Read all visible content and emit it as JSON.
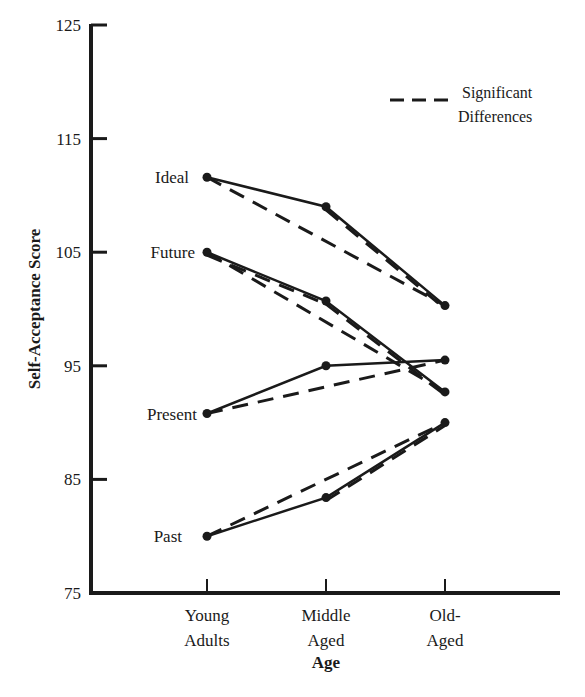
{
  "chart_data": {
    "type": "line",
    "title": "",
    "xlabel": "Age",
    "ylabel": "Self-Acceptance Score",
    "ylim": [
      75,
      125
    ],
    "yticks": [
      75,
      85,
      95,
      105,
      115,
      125
    ],
    "categories": [
      "Young Adults",
      "Middle Aged",
      "Old-Aged"
    ],
    "category_lines": [
      [
        "Young",
        "Adults"
      ],
      [
        "Middle",
        "Aged"
      ],
      [
        "Old-",
        "Aged"
      ]
    ],
    "grid": false,
    "legend": {
      "position": "top-right",
      "entries": [
        {
          "style": "dashed",
          "label_lines": [
            "Significant",
            "Differences"
          ],
          "label": "Significant Differences"
        }
      ]
    },
    "series": [
      {
        "name": "Ideal",
        "values": [
          111.6,
          109.0,
          100.3
        ]
      },
      {
        "name": "Future",
        "values": [
          105.0,
          100.7,
          92.7
        ]
      },
      {
        "name": "Present",
        "values": [
          90.8,
          95.0,
          95.5
        ]
      },
      {
        "name": "Past",
        "values": [
          80.0,
          83.4,
          90.0
        ]
      }
    ],
    "significant_differences": [
      {
        "series": "Ideal",
        "from": 0,
        "to": 2
      },
      {
        "series": "Ideal",
        "from": 1,
        "to": 2
      },
      {
        "series": "Future",
        "from": 0,
        "to": 2
      },
      {
        "series": "Future",
        "from": 0,
        "to": 1
      },
      {
        "series": "Future",
        "from": 1,
        "to": 2
      },
      {
        "series": "Present",
        "from": 0,
        "to": 2
      },
      {
        "series": "Past",
        "from": 0,
        "to": 2
      },
      {
        "series": "Past",
        "from": 1,
        "to": 2
      }
    ]
  },
  "colors": {
    "ink": "#1a1a1a",
    "background": "#ffffff"
  }
}
